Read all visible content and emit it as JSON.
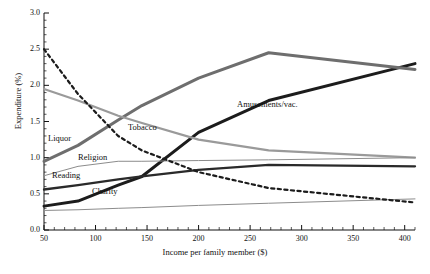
{
  "chart_data": {
    "type": "line",
    "title": "",
    "xlabel": "Income per family member ($)",
    "ylabel": "Expenditure (%)",
    "xlim": [
      50,
      410
    ],
    "ylim": [
      0.0,
      3.0
    ],
    "xticks": [
      50,
      100,
      150,
      200,
      250,
      300,
      350,
      400
    ],
    "yticks": [
      "0.0",
      "0.5",
      "1.0",
      "1.5",
      "2.0",
      "2.5",
      "3.0"
    ],
    "grid": false,
    "legend": "inline-labels",
    "series": [
      {
        "name": "Amusements/vac.",
        "color": "#1c1c1c",
        "width": 3.0,
        "dash": "none",
        "label_x": 237,
        "label_y": 99,
        "x": [
          50,
          83,
          122,
          145,
          200,
          268,
          410
        ],
        "y": [
          0.33,
          0.4,
          0.62,
          0.74,
          1.35,
          1.79,
          2.3
        ]
      },
      {
        "name": "Liquor",
        "color": "#6e6e6e",
        "width": 3.0,
        "dash": "none",
        "label_x": 48,
        "label_y": 133,
        "x": [
          50,
          83,
          122,
          145,
          200,
          268,
          410
        ],
        "y": [
          0.95,
          1.17,
          1.52,
          1.72,
          2.1,
          2.45,
          2.22
        ]
      },
      {
        "name": "Tobacco",
        "color": "#9a9a9a",
        "width": 2.2,
        "dash": "none",
        "label_x": 128,
        "label_y": 122,
        "x": [
          50,
          83,
          122,
          145,
          200,
          268,
          410
        ],
        "y": [
          1.95,
          1.79,
          1.58,
          1.48,
          1.25,
          1.1,
          1.0
        ]
      },
      {
        "name": "Religion",
        "color": "#8c8c8c",
        "width": 1.0,
        "dash": "none",
        "label_x": 78,
        "label_y": 152,
        "x": [
          50,
          83,
          122,
          145,
          200,
          268,
          410
        ],
        "y": [
          0.75,
          0.88,
          0.95,
          0.95,
          0.96,
          0.97,
          1.0
        ]
      },
      {
        "name": "Reading",
        "color": "#2a2a2a",
        "width": 2.3,
        "dash": "none",
        "label_x": 52,
        "label_y": 170,
        "x": [
          50,
          83,
          122,
          145,
          200,
          268,
          410
        ],
        "y": [
          0.56,
          0.62,
          0.7,
          0.74,
          0.83,
          0.9,
          0.88
        ]
      },
      {
        "name": "Charity",
        "color": "#8c8c8c",
        "width": 1.0,
        "dash": "none",
        "label_x": 92,
        "label_y": 186,
        "x": [
          50,
          83,
          122,
          145,
          200,
          268,
          410
        ],
        "y": [
          0.27,
          0.28,
          0.3,
          0.31,
          0.34,
          0.37,
          0.43
        ]
      },
      {
        "name": "unlabeled-dashed",
        "color": "#1c1c1c",
        "width": 2.2,
        "dash": "dashed",
        "label_x": null,
        "label_y": null,
        "x": [
          50,
          83,
          122,
          145,
          200,
          268,
          410
        ],
        "y": [
          2.5,
          1.88,
          1.3,
          1.1,
          0.8,
          0.58,
          0.38
        ]
      }
    ]
  },
  "axis": {
    "y_title": "Expenditure (%)",
    "x_title": "Income per family member ($)",
    "y_tick_labels": [
      "3.0",
      "2.5",
      "2.0",
      "1.5",
      "1.0",
      "0.5",
      "0.0"
    ],
    "x_tick_labels": [
      "50",
      "100",
      "150",
      "200",
      "250",
      "300",
      "350",
      "400"
    ]
  }
}
